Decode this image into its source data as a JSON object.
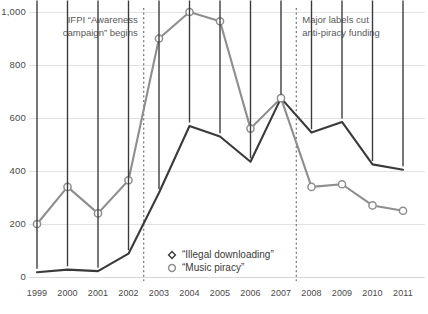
{
  "chart_data": {
    "type": "line",
    "title": "",
    "xlabel": "",
    "ylabel": "",
    "categories": [
      "1999",
      "2000",
      "2001",
      "2002",
      "2003",
      "2004",
      "2005",
      "2006",
      "2007",
      "2008",
      "2009",
      "2010",
      "2011"
    ],
    "ylim": [
      0,
      1000
    ],
    "yticks": [
      "0",
      "200",
      "400",
      "600",
      "800",
      "1,000"
    ],
    "ytick_values": [
      0,
      200,
      400,
      600,
      800,
      1000
    ],
    "grid": true,
    "legend_position": "inside-bottom-center",
    "series": [
      {
        "name": "“Illegal downloading”",
        "marker": "diamond",
        "color": "#3a3a3a",
        "values": [
          18,
          28,
          22,
          88,
          318,
          570,
          530,
          435,
          675,
          545,
          585,
          425,
          405
        ]
      },
      {
        "name": "“Music piracy”",
        "marker": "circle",
        "color": "#8e8e8e",
        "values": [
          200,
          340,
          240,
          365,
          900,
          1000,
          965,
          560,
          675,
          340,
          350,
          270,
          250
        ]
      }
    ],
    "annotations": [
      {
        "id": "ifpi-campaign",
        "text_lines": [
          "IFPI “Awareness",
          "campaign” begins"
        ],
        "x_position": 2002.5,
        "align": "right"
      },
      {
        "id": "labels-funding-cut",
        "text_lines": [
          "Major labels cut",
          "anti-piracy funding"
        ],
        "x_position": 2007.5,
        "align": "left"
      }
    ]
  },
  "legend": {
    "items": [
      {
        "label": "“Illegal downloading”",
        "marker": "diamond-marker-icon"
      },
      {
        "label": "“Music piracy”",
        "marker": "circle-marker-icon"
      }
    ]
  },
  "colors": {
    "illegal_downloading": "#3a3a3a",
    "music_piracy": "#8e8e8e",
    "gridline": "#e2e2e2",
    "annotation_line": "#555555",
    "background": "#ffffff"
  }
}
